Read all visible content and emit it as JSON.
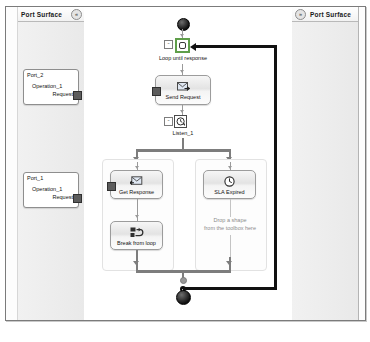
{
  "app": {
    "type": "orchestration-designer"
  },
  "left_panel": {
    "title": "Port Surface",
    "collapse_icon": "chevron-double-left-icon",
    "collapse_glyph": "«",
    "ports": [
      {
        "id": "port-shape-2",
        "name": "Port_2",
        "operation": "Operation_1",
        "message": "Request"
      },
      {
        "id": "port-shape-1",
        "name": "Port_1",
        "operation": "Operation_1",
        "message": "Request"
      }
    ]
  },
  "right_panel": {
    "title": "Port Surface",
    "expand_icon": "chevron-double-right-icon",
    "expand_glyph": "»"
  },
  "canvas": {
    "start_node": "start-terminator",
    "end_node": "end-terminator",
    "loop": {
      "label": "Loop until response",
      "icon": "loop-icon",
      "expander": "-",
      "selected": true,
      "selection_color": "#5f9e4a"
    },
    "send_request": {
      "label": "Send Request",
      "icon": "send-message-icon"
    },
    "listen": {
      "label": "Listen_1",
      "icon": "listen-clock-icon",
      "expander": "-"
    },
    "branches": [
      {
        "id": "branch-left",
        "activities": [
          {
            "id": "get-response",
            "label": "Get Response",
            "icon": "receive-message-icon"
          },
          {
            "id": "break-from-loop",
            "label": "Break from loop",
            "icon": "break-loop-icon"
          }
        ],
        "placeholder": null
      },
      {
        "id": "branch-right",
        "activities": [
          {
            "id": "sla-expired",
            "label": "SLA Expired",
            "icon": "clock-icon"
          }
        ],
        "placeholder": "Drop a shape\nfrom the toolbox here",
        "placeholder_line1": "Drop a shape",
        "placeholder_line2": "from the toolbox here"
      }
    ]
  },
  "colors": {
    "selection": "#5f9e4a",
    "connector": "#7d7d7d",
    "loopback": "#111111",
    "surface": "#ededed",
    "placeholder_text": "#8c8c8c"
  }
}
